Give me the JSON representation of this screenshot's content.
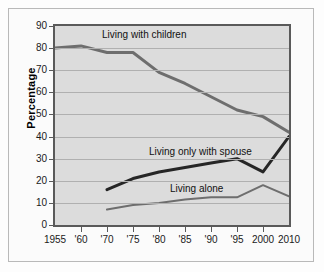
{
  "chart_data": {
    "type": "line",
    "title": "",
    "subtitle": "",
    "xlabel": "",
    "ylabel": "Percentage",
    "ylim": [
      0,
      90
    ],
    "ytick_step": 10,
    "yticks": [
      90,
      80,
      70,
      60,
      50,
      40,
      30,
      20,
      10,
      0
    ],
    "x": [
      "1955",
      "'60",
      "'70",
      "'75",
      "'80",
      "'85",
      "'90",
      "'95",
      "2000",
      "2010"
    ],
    "categories": [
      "1955",
      "'60",
      "'70",
      "'75",
      "'80",
      "'85",
      "'90",
      "'95",
      "2000",
      "2010"
    ],
    "grid": "horizontal",
    "legend": "inline-labels",
    "series": [
      {
        "name": "Living with children",
        "color": "#6e6e6e",
        "width": 3,
        "values": [
          80,
          81,
          78,
          78,
          69,
          64,
          58,
          52,
          49,
          42
        ]
      },
      {
        "name": "Living only with spouse",
        "color": "#262626",
        "width": 3,
        "values": [
          null,
          null,
          16,
          21,
          24,
          26,
          28,
          30,
          24,
          40
        ]
      },
      {
        "name": "Living alone",
        "color": "#6e6e6e",
        "width": 2,
        "values": [
          null,
          null,
          7,
          9,
          10,
          11.5,
          12.5,
          12.5,
          18,
          13
        ]
      }
    ],
    "annotations": [
      {
        "text": "Living with children",
        "x_frac": 0.2,
        "y_value": 86
      },
      {
        "text": "Living only with spouse",
        "x_frac": 0.4,
        "y_value": 33
      },
      {
        "text": "Living alone",
        "x_frac": 0.49,
        "y_value": 16.5
      }
    ]
  },
  "axis": {
    "y_title": "Percentage",
    "y_labels": [
      "90",
      "80",
      "70",
      "60",
      "50",
      "40",
      "30",
      "20",
      "10",
      "0"
    ],
    "x_labels": [
      "1955",
      "'60",
      "'70",
      "'75",
      "'80",
      "'85",
      "'90",
      "'95",
      "2000",
      "2010"
    ]
  },
  "labels": {
    "children": "Living with children",
    "spouse": "Living only with spouse",
    "alone": "Living alone"
  },
  "colors": {
    "plot_background": "#dcdcdc",
    "frame": "#5a5a5a",
    "grid": "#b0b0b0",
    "series_children": "#6e6e6e",
    "series_spouse": "#262626",
    "series_alone": "#6e6e6e",
    "page_background": "#fdfdfd"
  }
}
